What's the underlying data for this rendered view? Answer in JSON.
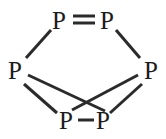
{
  "figure": {
    "name": "phosphorus-cluster-structure",
    "background_color": "#ffffff",
    "bond_color": "#2b2b2b",
    "label_color": "#1c1c1c"
  },
  "atoms": [
    {
      "id": "top-left",
      "label": "P",
      "x": 59,
      "y": 20
    },
    {
      "id": "top-right",
      "label": "P",
      "x": 107,
      "y": 20
    },
    {
      "id": "mid-left",
      "label": "P",
      "x": 15,
      "y": 70
    },
    {
      "id": "mid-right",
      "label": "P",
      "x": 151,
      "y": 70
    },
    {
      "id": "bot-left",
      "label": "P",
      "x": 66,
      "y": 120
    },
    {
      "id": "bot-right",
      "label": "P",
      "x": 103,
      "y": 120
    }
  ],
  "bonds": [
    {
      "id": "top-double-bond",
      "from": "top-left",
      "to": "top-right",
      "order": 2
    },
    {
      "id": "bottom-single-bond",
      "from": "bot-left",
      "to": "bot-right",
      "order": 1
    },
    {
      "id": "upper-left-bond",
      "from": "mid-left",
      "to": "top-left",
      "order": 1
    },
    {
      "id": "upper-right-bond",
      "from": "mid-right",
      "to": "top-right",
      "order": 1
    },
    {
      "id": "lower-left-bond",
      "from": "mid-left",
      "to": "bot-left",
      "order": 1
    },
    {
      "id": "lower-right-bond",
      "from": "mid-right",
      "to": "bot-right",
      "order": 1
    },
    {
      "id": "cross-bond-left-to-bottom-right",
      "from": "mid-left",
      "to": "bot-right",
      "order": 1
    },
    {
      "id": "cross-bond-right-to-bottom-left",
      "from": "mid-right",
      "to": "bot-left",
      "order": 1
    }
  ]
}
